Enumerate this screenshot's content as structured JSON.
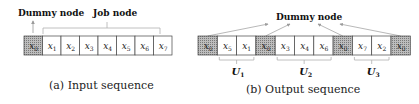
{
  "panel_a": {
    "dummy_label": "Dummy node",
    "job_label": "Job node",
    "caption": "(a) Input sequence",
    "cells": [
      {
        "var": "x",
        "sub": "0",
        "dummy": true
      },
      {
        "var": "x",
        "sub": "1",
        "dummy": false
      },
      {
        "var": "x",
        "sub": "2",
        "dummy": false
      },
      {
        "var": "x",
        "sub": "3",
        "dummy": false
      },
      {
        "var": "x",
        "sub": "4",
        "dummy": false
      },
      {
        "var": "x",
        "sub": "5",
        "dummy": false
      },
      {
        "var": "x",
        "sub": "6",
        "dummy": false
      },
      {
        "var": "x",
        "sub": "7",
        "dummy": false
      }
    ]
  },
  "panel_b": {
    "dummy_label": "Dummy node",
    "caption": "(b) Output sequence",
    "cells": [
      {
        "var": "x",
        "sub": "0",
        "dummy": true
      },
      {
        "var": "x",
        "sub": "5",
        "dummy": false
      },
      {
        "var": "x",
        "sub": "1",
        "dummy": false
      },
      {
        "var": "x",
        "sub": "0",
        "dummy": true
      },
      {
        "var": "x",
        "sub": "3",
        "dummy": false
      },
      {
        "var": "x",
        "sub": "4",
        "dummy": false
      },
      {
        "var": "x",
        "sub": "6",
        "dummy": false
      },
      {
        "var": "x",
        "sub": "0",
        "dummy": true
      },
      {
        "var": "x",
        "sub": "7",
        "dummy": false
      },
      {
        "var": "x",
        "sub": "2",
        "dummy": false
      },
      {
        "var": "x",
        "sub": "0",
        "dummy": true
      }
    ],
    "groups": [
      {
        "label": "U",
        "sub": "1",
        "from": 1,
        "to": 2
      },
      {
        "label": "U",
        "sub": "2",
        "from": 4,
        "to": 6
      },
      {
        "label": "U",
        "sub": "3",
        "from": 8,
        "to": 9
      }
    ]
  },
  "colors": {
    "dummy_fill": "#a9a9a9",
    "cell_border": "#444444",
    "bracket": "#b0b0b0",
    "arrow": "#9a9a9a"
  }
}
